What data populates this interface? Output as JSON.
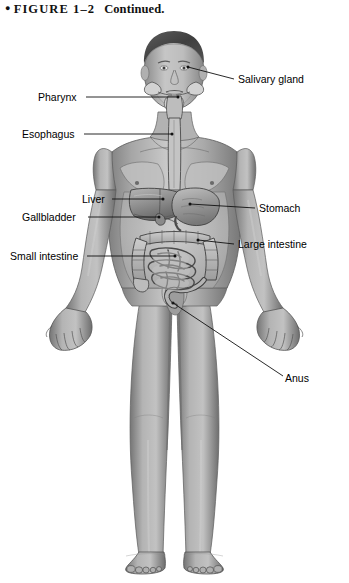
{
  "caption": {
    "bullet": "●",
    "figure_number": "FIGURE 1–2",
    "continued": "Continued."
  },
  "figure": {
    "view": "anterior-full-body",
    "style": "grayscale-medical-illustration",
    "colors": {
      "background": "#ffffff",
      "skin_light": "#c9c9c9",
      "skin_mid": "#9a9a9a",
      "skin_shadow": "#6f6f6f",
      "hair": "#4a4a4a",
      "organ_light": "#b8b8b8",
      "organ_mid": "#8e8e8e",
      "organ_dark": "#5f5f5f",
      "outline": "#3a3a3a",
      "leader_line": "#1a1a1a"
    }
  },
  "labels": {
    "left": [
      {
        "text": "Pharynx",
        "x": 38,
        "y": 92,
        "line_x1": 86,
        "line_y1": 97,
        "line_x2": 178,
        "line_y2": 97
      },
      {
        "text": "Esophagus",
        "x": 22,
        "y": 129,
        "line_x1": 84,
        "line_y1": 134,
        "line_x2": 172,
        "line_y2": 134
      },
      {
        "text": "Liver",
        "x": 82,
        "y": 194,
        "line_x1": 112,
        "line_y1": 199,
        "line_x2": 163,
        "line_y2": 199
      },
      {
        "text": "Gallbladder",
        "x": 22,
        "y": 212,
        "line_x1": 88,
        "line_y1": 217,
        "line_x2": 159,
        "line_y2": 217
      },
      {
        "text": "Small intestine",
        "x": 10,
        "y": 251,
        "line_x1": 87,
        "line_y1": 256,
        "line_x2": 175,
        "line_y2": 256
      }
    ],
    "right": [
      {
        "text": "Salivary gland",
        "x": 238,
        "y": 74,
        "line_x1": 234,
        "line_y1": 79,
        "line_x2": 188,
        "line_y2": 67
      },
      {
        "text": "Stomach",
        "x": 259,
        "y": 203,
        "line_x1": 255,
        "line_y1": 208,
        "line_x2": 190,
        "line_y2": 204
      },
      {
        "text": "Large intestine",
        "x": 238,
        "y": 239,
        "line_x1": 234,
        "line_y1": 244,
        "line_x2": 198,
        "line_y2": 240
      },
      {
        "text": "Anus",
        "x": 285,
        "y": 373,
        "line_x1": 283,
        "line_y1": 376,
        "line_x2": 173,
        "line_y2": 303
      }
    ]
  },
  "anatomy_parts": [
    "salivary-gland",
    "pharynx",
    "esophagus",
    "stomach",
    "liver",
    "gallbladder",
    "small-intestine",
    "large-intestine",
    "anus"
  ]
}
